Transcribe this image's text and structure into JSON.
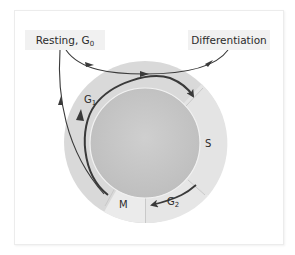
{
  "diagram": {
    "labels": {
      "resting": {
        "text": "Resting, G",
        "sub": "0"
      },
      "differentiation": {
        "text": "Differentiation"
      }
    },
    "phases": [
      {
        "name": "G",
        "sub": "1"
      },
      {
        "name": "S",
        "sub": ""
      },
      {
        "name": "G",
        "sub": "2"
      },
      {
        "name": "M",
        "sub": ""
      }
    ],
    "colors": {
      "outer_ring": "#d9d9d9",
      "inner_disc": "#c7c7c7",
      "label_box": "#f1f1f1",
      "arrow": "#3a3a3a",
      "phase_band": "#e9e9e9"
    }
  }
}
